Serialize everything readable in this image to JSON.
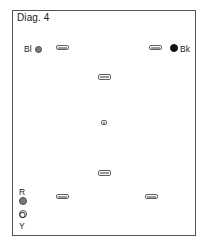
{
  "diagram": {
    "title": "Diag. 4",
    "frame": {
      "x": 12,
      "y": 10,
      "w": 184,
      "h": 226,
      "border_color": "#555555"
    },
    "labels": [
      {
        "name": "label-bl",
        "text": "Bl",
        "x": 24,
        "y": 45
      },
      {
        "name": "label-bk",
        "text": "Bk",
        "x": 180,
        "y": 45
      },
      {
        "name": "label-r",
        "text": "R",
        "x": 19,
        "y": 188
      },
      {
        "name": "label-o",
        "text": "O",
        "x": 19,
        "y": 211
      },
      {
        "name": "label-y",
        "text": "Y",
        "x": 19,
        "y": 222
      }
    ],
    "circles": [
      {
        "name": "circle-bl-gray",
        "style": "filled-gray",
        "cx": 38,
        "cy": 49,
        "r": 3.5,
        "color": "#7a7a7a"
      },
      {
        "name": "circle-bk-black",
        "style": "filled-black",
        "cx": 174,
        "cy": 48,
        "r": 4.0,
        "color": "#111111"
      },
      {
        "name": "circle-r-filled",
        "style": "filled-gray",
        "cx": 23,
        "cy": 201,
        "r": 4.0,
        "color": "#7a7a7a"
      },
      {
        "name": "circle-o-open",
        "style": "open",
        "cx": 23,
        "cy": 214,
        "r": 4.0,
        "color": "#ffffff"
      }
    ],
    "pills": [
      {
        "name": "pill-top-left",
        "x": 56,
        "y": 45,
        "w": 13,
        "h": 5
      },
      {
        "name": "pill-top-right",
        "x": 149,
        "y": 45,
        "w": 13,
        "h": 5
      },
      {
        "name": "pill-upper-center",
        "x": 98,
        "y": 74,
        "w": 13,
        "h": 6
      },
      {
        "name": "pill-center",
        "x": 101,
        "y": 120,
        "w": 6,
        "h": 5
      },
      {
        "name": "pill-lower-center",
        "x": 98,
        "y": 170,
        "w": 13,
        "h": 6
      },
      {
        "name": "pill-bottom-left",
        "x": 56,
        "y": 194,
        "w": 13,
        "h": 5
      },
      {
        "name": "pill-bottom-right",
        "x": 145,
        "y": 194,
        "w": 13,
        "h": 5
      }
    ]
  }
}
